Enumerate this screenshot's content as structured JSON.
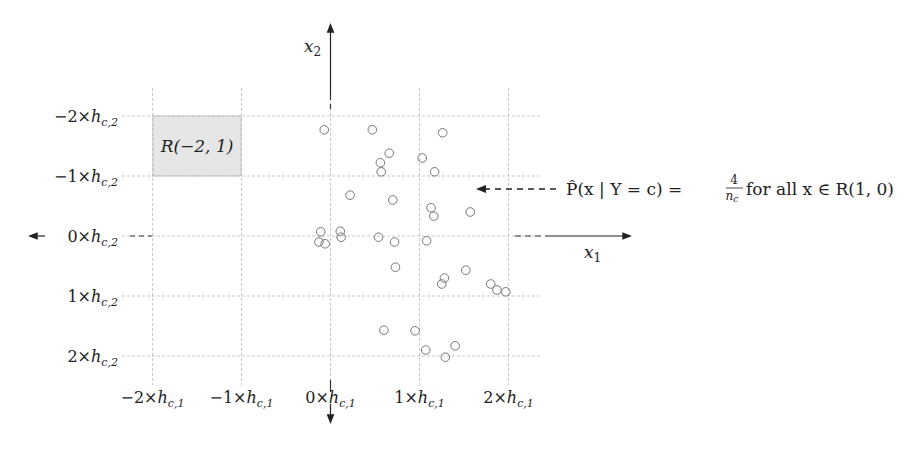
{
  "figure": {
    "type": "histogram-bin-grid-diagram",
    "axes": {
      "x_axis_label": "x",
      "x_axis_subscript": "1",
      "y_axis_label": "x",
      "y_axis_subscript": "2"
    },
    "x_tick_labels": [
      {
        "coef": "−2",
        "h": "h",
        "sub": "c,1"
      },
      {
        "coef": "−1",
        "h": "h",
        "sub": "c,1"
      },
      {
        "coef": "0",
        "h": "h",
        "sub": "c,1"
      },
      {
        "coef": "1",
        "h": "h",
        "sub": "c,1"
      },
      {
        "coef": "2",
        "h": "h",
        "sub": "c,1"
      }
    ],
    "y_tick_labels": [
      {
        "coef": "2",
        "h": "h",
        "sub": "c,2"
      },
      {
        "coef": "1",
        "h": "h",
        "sub": "c,2"
      },
      {
        "coef": "0",
        "h": "h",
        "sub": "c,2"
      },
      {
        "coef": "−1",
        "h": "h",
        "sub": "c,2"
      },
      {
        "coef": "−2",
        "h": "h",
        "sub": "c,2"
      }
    ],
    "highlighted_region": {
      "label": "R(−2, 1)",
      "x_range": [
        -2,
        -1
      ],
      "y_range": [
        1,
        2
      ],
      "fill": "#e6e6e6"
    },
    "annotation": {
      "text_prefix": "P̂(x | Y = c) = ",
      "fraction_num": "4",
      "fraction_den": "n",
      "fraction_den_sub": "c",
      "text_suffix": " for all x ∈ R(1, 0)",
      "points_to_region": "R(1, 0)"
    },
    "colors": {
      "grid": "#bbbbbb",
      "axis": "#222222",
      "marker": "#777777",
      "region": "#e6e6e6"
    }
  },
  "chart_data": {
    "type": "scatter",
    "title": "",
    "xlabel": "x1",
    "ylabel": "x2",
    "xlim": [
      -2.4,
      2.4
    ],
    "ylim": [
      -2.4,
      2.4
    ],
    "grid": true,
    "grid_units": "bin widths h_c,1 (x) and h_c,2 (y)",
    "x_ticks": [
      -2,
      -1,
      0,
      1,
      2
    ],
    "y_ticks": [
      -2,
      -1,
      0,
      1,
      2
    ],
    "marker": "hollow circle",
    "points": [
      {
        "x": -0.07,
        "y": 1.77
      },
      {
        "x": 0.47,
        "y": 1.77
      },
      {
        "x": 1.26,
        "y": 1.72
      },
      {
        "x": 0.66,
        "y": 1.38
      },
      {
        "x": 0.56,
        "y": 1.22
      },
      {
        "x": 1.03,
        "y": 1.3
      },
      {
        "x": 0.57,
        "y": 1.07
      },
      {
        "x": 1.17,
        "y": 1.07
      },
      {
        "x": 0.22,
        "y": 0.68
      },
      {
        "x": 0.7,
        "y": 0.6
      },
      {
        "x": 1.13,
        "y": 0.47
      },
      {
        "x": 1.16,
        "y": 0.33
      },
      {
        "x": 1.57,
        "y": 0.4
      },
      {
        "x": -0.11,
        "y": 0.07
      },
      {
        "x": 0.11,
        "y": 0.08
      },
      {
        "x": 0.12,
        "y": -0.02
      },
      {
        "x": -0.13,
        "y": -0.1
      },
      {
        "x": -0.06,
        "y": -0.13
      },
      {
        "x": 0.54,
        "y": -0.02
      },
      {
        "x": 0.72,
        "y": -0.1
      },
      {
        "x": 1.08,
        "y": -0.08
      },
      {
        "x": 0.73,
        "y": -0.52
      },
      {
        "x": 1.52,
        "y": -0.57
      },
      {
        "x": 1.28,
        "y": -0.7
      },
      {
        "x": 1.25,
        "y": -0.8
      },
      {
        "x": 1.8,
        "y": -0.8
      },
      {
        "x": 1.87,
        "y": -0.9
      },
      {
        "x": 1.97,
        "y": -0.93
      },
      {
        "x": 0.6,
        "y": -1.57
      },
      {
        "x": 0.95,
        "y": -1.58
      },
      {
        "x": 1.07,
        "y": -1.9
      },
      {
        "x": 1.4,
        "y": -1.83
      },
      {
        "x": 1.29,
        "y": -2.02
      }
    ]
  }
}
